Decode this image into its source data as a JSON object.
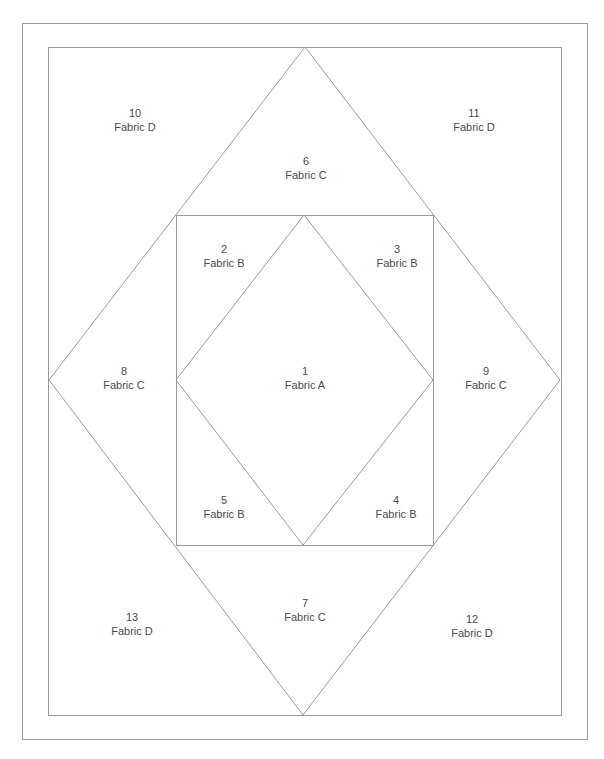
{
  "diagram": {
    "title": "",
    "colors": {
      "background": "#ffffff",
      "line": "#9a9a9a",
      "text": "#4a4a4a"
    },
    "shapes": {
      "outer_border": {
        "x1": 22,
        "y1": 23,
        "x2": 587,
        "y2": 739
      },
      "block_border": {
        "x1": 48,
        "y1": 47,
        "x2": 561,
        "y2": 715
      },
      "large_diamond": {
        "top": [
          305,
          47
        ],
        "right": [
          560,
          380
        ],
        "bottom": [
          303,
          715
        ],
        "left": [
          49,
          380
        ]
      },
      "center_square": {
        "x1": 176,
        "y1": 215,
        "x2": 433,
        "y2": 545
      },
      "inner_diamond": {
        "top": [
          304,
          215
        ],
        "right": [
          433,
          380
        ],
        "bottom": [
          303,
          545
        ],
        "left": [
          176,
          380
        ]
      }
    },
    "pieces": [
      {
        "number": "1",
        "fabric": "Fabric A",
        "x": 305,
        "y": 364
      },
      {
        "number": "2",
        "fabric": "Fabric B",
        "x": 224,
        "y": 242
      },
      {
        "number": "3",
        "fabric": "Fabric B",
        "x": 397,
        "y": 242
      },
      {
        "number": "4",
        "fabric": "Fabric B",
        "x": 396,
        "y": 493
      },
      {
        "number": "5",
        "fabric": "Fabric B",
        "x": 224,
        "y": 493
      },
      {
        "number": "6",
        "fabric": "Fabric C",
        "x": 306,
        "y": 154
      },
      {
        "number": "7",
        "fabric": "Fabric C",
        "x": 305,
        "y": 596
      },
      {
        "number": "8",
        "fabric": "Fabric C",
        "x": 124,
        "y": 364
      },
      {
        "number": "9",
        "fabric": "Fabric C",
        "x": 486,
        "y": 364
      },
      {
        "number": "10",
        "fabric": "Fabric D",
        "x": 135,
        "y": 106
      },
      {
        "number": "11",
        "fabric": "Fabric D",
        "x": 474,
        "y": 106
      },
      {
        "number": "12",
        "fabric": "Fabric D",
        "x": 472,
        "y": 612
      },
      {
        "number": "13",
        "fabric": "Fabric D",
        "x": 132,
        "y": 610
      }
    ]
  }
}
